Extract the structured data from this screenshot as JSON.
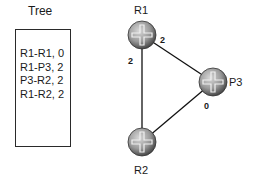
{
  "tree": {
    "title": "Tree",
    "entries": [
      "R1-R1, 0",
      "R1-P3, 2",
      "P3-R2, 2",
      "R1-R2, 2"
    ]
  },
  "nodes": [
    {
      "id": "R1",
      "label": "R1"
    },
    {
      "id": "P3",
      "label": "P3"
    },
    {
      "id": "R2",
      "label": "R2"
    }
  ],
  "links": [
    {
      "from": "R1",
      "to": "P3",
      "cost_label": "2"
    },
    {
      "from": "R1",
      "to": "R2",
      "cost_label": "2"
    },
    {
      "from": "P3",
      "to": "R2",
      "cost_label": "0"
    }
  ]
}
